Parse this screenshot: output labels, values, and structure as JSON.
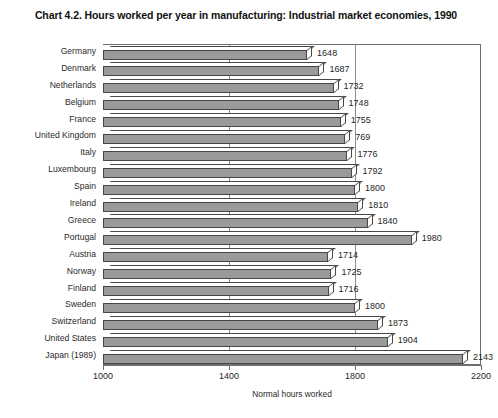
{
  "chart_data": {
    "type": "bar",
    "orientation": "horizontal",
    "title": "Chart 4.2.  Hours worked per year in manufacturing: Industrial market economies, 1990",
    "xlabel": "Normal hours worked",
    "ylabel": "",
    "xlim": [
      1000,
      2200
    ],
    "xticks": [
      1000,
      1400,
      1800,
      2200
    ],
    "xtick_labels": [
      "1000",
      "1400",
      "1800",
      "2200"
    ],
    "grid": true,
    "grid_axis": "x",
    "legend": null,
    "bar_color": "#9a9a9a",
    "bar_edge_color": "#474747",
    "categories": [
      "Germany",
      "Denmark",
      "Netherlands",
      "Belgium",
      "France",
      "United Kingdom",
      "Italy",
      "Luxembourg",
      "Spain",
      "Ireland",
      "Greece",
      "Portugal",
      "Austria",
      "Norway",
      "Finland",
      "Sweden",
      "Switzerland",
      "United States",
      "Japan (1989)"
    ],
    "values": [
      1648,
      1687,
      1732,
      1748,
      1755,
      1769,
      1776,
      1792,
      1800,
      1810,
      1840,
      1980,
      1714,
      1725,
      1716,
      1800,
      1873,
      1904,
      2143
    ],
    "data_labels": [
      "1648",
      "1687",
      "1732",
      "1748",
      "1755",
      "769",
      "1776",
      "1792",
      "1800",
      "1810",
      "1840",
      "1980",
      "1714",
      "1725",
      "1716",
      "1800",
      "1873",
      "1904",
      "2143"
    ]
  }
}
